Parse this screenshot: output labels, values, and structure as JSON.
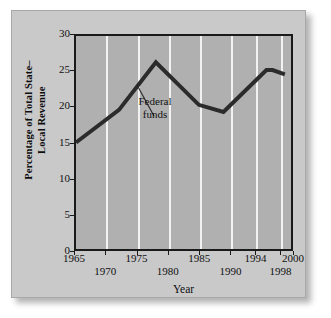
{
  "chart_data": {
    "type": "line",
    "title": "",
    "xlabel": "Year",
    "ylabel": "Percentage of Total State–Local Revenue",
    "ylabel_line1": "Percentage of Total State–",
    "ylabel_line2": "Local Revenue",
    "xlim": [
      1965,
      2000
    ],
    "ylim": [
      0,
      30
    ],
    "grid": "vertical-white-gridlines",
    "legend": "none",
    "yticks": [
      0,
      5,
      10,
      15,
      20,
      25,
      30
    ],
    "ytick_labels": [
      "0",
      "5",
      "10",
      "15",
      "20",
      "25",
      "30"
    ],
    "xticks": [
      1965,
      1970,
      1975,
      1980,
      1985,
      1990,
      1994,
      1998,
      2000
    ],
    "xtick_labels": [
      "1965",
      "1970",
      "1975",
      "1980",
      "1985",
      "1990",
      "1994",
      "1998",
      "2000"
    ],
    "xtick_rows": [
      "top",
      "bottom",
      "top",
      "bottom",
      "top",
      "bottom",
      "top",
      "bottom",
      "top"
    ],
    "gridline_years": [
      1970,
      1975,
      1980,
      1985,
      1990,
      1994,
      1998
    ],
    "series": [
      {
        "name": "Federal funds",
        "color": "#2b2b2b",
        "x": [
          1965,
          1972,
          1978,
          1985,
          1989,
          1996,
          1997,
          1999
        ],
        "values": [
          15.0,
          19.6,
          26.3,
          20.3,
          19.3,
          25.2,
          25.2,
          24.6
        ]
      }
    ],
    "annotations": [
      {
        "text_line1": "Federal",
        "text_line2": "funds",
        "points_to_x": 1975,
        "points_to_y": 23.4
      }
    ]
  },
  "annotation": {
    "line1": "Federal",
    "line2": "funds"
  },
  "axes": {
    "x_title": "Year",
    "y_title_line1": "Percentage of Total State–",
    "y_title_line2": "Local Revenue"
  },
  "colors": {
    "page_background": "#ffffff",
    "card_background": "#c9c9c9",
    "plot_background": "#b0b0b0",
    "gridline": "#f2f2f2",
    "axis": "#1a1a1a",
    "series_line": "#2b2b2b",
    "text": "#101010"
  }
}
